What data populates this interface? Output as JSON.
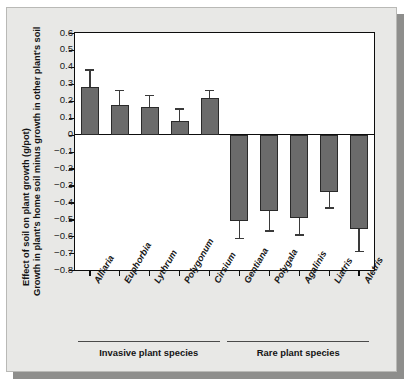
{
  "figure": {
    "background_color": "#e8e8e6",
    "bar_color": "#6b6b6b",
    "axis_color": "#0d0d0d"
  },
  "chart_data": {
    "type": "bar",
    "title": "",
    "subtitle": "",
    "ylabel_line1": "Effect of soil on plant growth (g/pot)",
    "ylabel_line2": "Growth in plant's home soil minus growth in other plant's soil",
    "xlabel": "",
    "ylim": [
      -0.8,
      0.6
    ],
    "ytick_values": [
      0.6,
      0.5,
      0.4,
      0.3,
      0.2,
      0.1,
      0,
      -0.1,
      -0.2,
      -0.3,
      -0.4,
      -0.5,
      -0.6,
      -0.7,
      -0.8
    ],
    "ytick_labels": [
      "0.6",
      "0.5",
      "0.4",
      "0.3",
      "0.2",
      "0.1",
      "0",
      "−0.1",
      "−0.2",
      "−0.3",
      "−0.4",
      "−0.5",
      "−0.6",
      "−0.7",
      "−0.8"
    ],
    "grid": false,
    "legend": null,
    "categories": [
      "Alliaria",
      "Euphorbia",
      "Lythrum",
      "Polygonum",
      "Cirsium",
      "Gentiana",
      "Polygala",
      "Agalinis",
      "Liatris",
      "Aletris"
    ],
    "values": [
      0.28,
      0.175,
      0.165,
      0.08,
      0.215,
      -0.51,
      -0.45,
      -0.49,
      -0.34,
      -0.56
    ],
    "errors": [
      0.105,
      0.09,
      0.07,
      0.075,
      0.05,
      0.1,
      0.115,
      0.1,
      0.09,
      0.125
    ],
    "error_upper": [
      0.385,
      0.265,
      0.235,
      0.155,
      0.265,
      -0.61,
      -0.565,
      -0.59,
      -0.43,
      -0.685
    ],
    "groups": [
      {
        "label": "Invasive plant species",
        "first_index": 0,
        "last_index": 4
      },
      {
        "label": "Rare plant species",
        "first_index": 5,
        "last_index": 9
      }
    ]
  }
}
